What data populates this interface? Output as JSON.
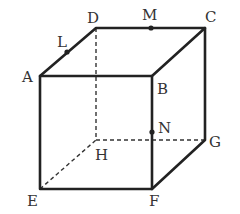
{
  "diagram": {
    "vertices": {
      "A": {
        "label": "A",
        "x": 40,
        "y": 76,
        "lx": 22,
        "ly": 82
      },
      "B": {
        "label": "B",
        "x": 152,
        "y": 76,
        "lx": 157,
        "ly": 94
      },
      "C": {
        "label": "C",
        "x": 205,
        "y": 28,
        "lx": 205,
        "ly": 22
      },
      "D": {
        "label": "D",
        "x": 96,
        "y": 28,
        "lx": 87,
        "ly": 23
      },
      "E": {
        "label": "E",
        "x": 40,
        "y": 189,
        "lx": 27,
        "ly": 206
      },
      "F": {
        "label": "F",
        "x": 152,
        "y": 189,
        "lx": 153,
        "ly": 206
      },
      "G": {
        "label": "G",
        "x": 205,
        "y": 140,
        "lx": 209,
        "ly": 147
      },
      "H": {
        "label": "H",
        "x": 96,
        "y": 140,
        "lx": 95,
        "ly": 160
      }
    },
    "points": {
      "L": {
        "label": "L",
        "x": 67,
        "y": 52,
        "lx": 57,
        "ly": 47
      },
      "M": {
        "label": "M",
        "x": 151,
        "y": 28,
        "lx": 144,
        "ly": 20
      },
      "N": {
        "label": "N",
        "x": 152,
        "y": 132,
        "lx": 158,
        "ly": 132
      }
    }
  }
}
